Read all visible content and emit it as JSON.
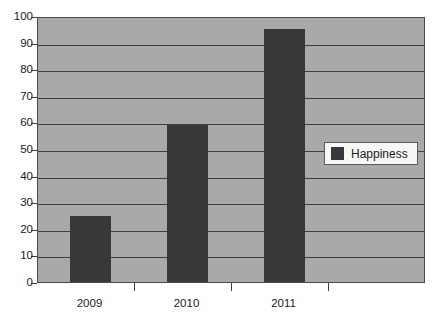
{
  "chart_data": {
    "type": "bar",
    "title": "",
    "subtitle": "",
    "xlabel": "",
    "ylabel": "",
    "categories": [
      "2009",
      "2010",
      "2011"
    ],
    "series": [
      {
        "name": "Happiness",
        "values": [
          25,
          59,
          95
        ],
        "color": "#383838"
      }
    ],
    "ylim": [
      0,
      100
    ],
    "y_ticks": [
      0,
      10,
      20,
      30,
      40,
      50,
      60,
      70,
      80,
      90,
      100
    ],
    "y_tick_labels": [
      "0",
      "10",
      "20",
      "30",
      "40",
      "50",
      "60",
      "70",
      "80",
      "90",
      "100"
    ],
    "grid": true,
    "grid_axis": "y",
    "legend": {
      "position": "center-right-inside",
      "entries": [
        {
          "label": "Happiness",
          "color": "#383838"
        }
      ]
    },
    "plot_background": "#a9a9a9",
    "figure_background": "#ffffff",
    "axis_color": "#3f3f3f",
    "empty_trailing_slot": true
  }
}
